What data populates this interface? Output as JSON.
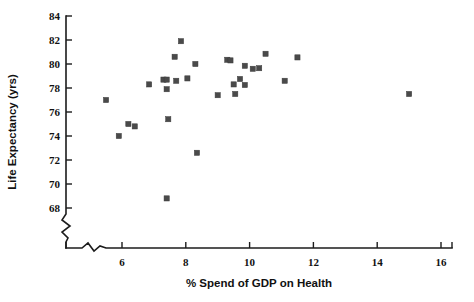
{
  "chart_data": {
    "type": "scatter",
    "title": "",
    "xlabel": "% Spend of GDP on Health",
    "ylabel": "Life Expectancy (yrs)",
    "xlim": [
      4.6,
      16.4
    ],
    "ylim": [
      67.0,
      84.6
    ],
    "xticks": [
      6,
      8,
      10,
      12,
      14,
      16
    ],
    "yticks": [
      68,
      70,
      72,
      74,
      76,
      78,
      80,
      82,
      84
    ],
    "xtick_labels": [
      "6",
      "8",
      "10",
      "12",
      "14",
      "16"
    ],
    "ytick_labels": [
      "68",
      "70",
      "72",
      "74",
      "76",
      "78",
      "80",
      "82",
      "84"
    ],
    "grid": false,
    "legend": null,
    "axis_break_x": true,
    "axis_break_y": true,
    "marker": "square",
    "marker_color": "#4a4a4a",
    "points": [
      {
        "x": 5.5,
        "y": 77.0
      },
      {
        "x": 5.9,
        "y": 74.0
      },
      {
        "x": 6.2,
        "y": 75.0
      },
      {
        "x": 6.4,
        "y": 74.8
      },
      {
        "x": 6.85,
        "y": 78.3
      },
      {
        "x": 7.3,
        "y": 78.7
      },
      {
        "x": 7.4,
        "y": 78.7
      },
      {
        "x": 7.4,
        "y": 77.9
      },
      {
        "x": 7.45,
        "y": 75.4
      },
      {
        "x": 7.4,
        "y": 68.8
      },
      {
        "x": 7.65,
        "y": 80.6
      },
      {
        "x": 7.7,
        "y": 78.6
      },
      {
        "x": 7.85,
        "y": 81.9
      },
      {
        "x": 8.05,
        "y": 78.8
      },
      {
        "x": 8.3,
        "y": 80.0
      },
      {
        "x": 8.35,
        "y": 72.6
      },
      {
        "x": 9.0,
        "y": 77.4
      },
      {
        "x": 9.3,
        "y": 80.35
      },
      {
        "x": 9.4,
        "y": 80.3
      },
      {
        "x": 9.5,
        "y": 78.3
      },
      {
        "x": 9.55,
        "y": 77.5
      },
      {
        "x": 9.7,
        "y": 78.75
      },
      {
        "x": 9.85,
        "y": 79.85
      },
      {
        "x": 9.85,
        "y": 78.25
      },
      {
        "x": 10.1,
        "y": 79.6
      },
      {
        "x": 10.3,
        "y": 79.65
      },
      {
        "x": 10.5,
        "y": 80.85
      },
      {
        "x": 11.1,
        "y": 78.6
      },
      {
        "x": 11.5,
        "y": 80.55
      },
      {
        "x": 15.0,
        "y": 77.5
      }
    ]
  }
}
